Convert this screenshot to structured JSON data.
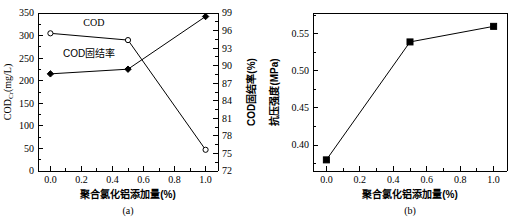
{
  "figure": {
    "panels": [
      {
        "id": "a",
        "caption": "(a)"
      },
      {
        "id": "b",
        "caption": "(b)"
      }
    ]
  },
  "chart_data": [
    {
      "type": "line",
      "panel": "(a)",
      "title": "",
      "xlabel": "聚合氯化铝添加量(%)",
      "ylabel": "CODCr(mg/L)",
      "ylabel_main": "COD",
      "ylabel_sub": "Cr",
      "ylabel_unit": "(mg/L)",
      "y2label": "COD固结率(%)",
      "x": [
        0.0,
        0.5,
        1.0
      ],
      "xlim": [
        -0.08,
        1.08
      ],
      "ylim": [
        0,
        350
      ],
      "y2lim": [
        72,
        99
      ],
      "xticks": [
        0.0,
        0.2,
        0.4,
        0.6,
        0.8,
        1.0
      ],
      "xticklabels": [
        "0.0",
        "0.2",
        "0.4",
        "0.6",
        "0.8",
        "1.0"
      ],
      "yticks": [
        0,
        50,
        100,
        150,
        200,
        250,
        300,
        350
      ],
      "yticklabels": [
        "0",
        "50",
        "100",
        "150",
        "200",
        "250",
        "300",
        "350"
      ],
      "y2ticks": [
        72,
        75,
        78,
        81,
        84,
        87,
        90,
        93,
        96,
        99
      ],
      "y2ticklabels": [
        "72",
        "75",
        "78",
        "81",
        "84",
        "87",
        "90",
        "93",
        "96",
        "99"
      ],
      "grid": false,
      "legend_position": "inline-annotation",
      "series": [
        {
          "name": "COD",
          "axis": "left",
          "marker": "open-circle",
          "values": [
            305,
            290,
            47
          ],
          "annotation": "COD",
          "annotation_x": 0.28,
          "annotation_y": 322
        },
        {
          "name": "COD固结率",
          "axis": "right",
          "marker": "filled-diamond",
          "values": [
            88.6,
            89.4,
            98.4
          ],
          "annotation": "COD固结率",
          "annotation_x": 0.25,
          "annotation_y": 91.5
        }
      ]
    },
    {
      "type": "line",
      "panel": "(b)",
      "title": "",
      "xlabel": "聚合氯化铝添加量(%)",
      "ylabel": "抗压强度(MPa)",
      "x": [
        0.0,
        0.5,
        1.0
      ],
      "xlim": [
        -0.08,
        1.08
      ],
      "ylim": [
        0.365,
        0.578
      ],
      "xticks": [
        0.0,
        0.2,
        0.4,
        0.6,
        0.8,
        1.0
      ],
      "xticklabels": [
        "0.0",
        "0.2",
        "0.4",
        "0.6",
        "0.8",
        "1.0"
      ],
      "yticks": [
        0.4,
        0.45,
        0.5,
        0.55
      ],
      "yticklabels": [
        "0.40",
        "0.45",
        "0.50",
        "0.55"
      ],
      "grid": false,
      "legend_position": "none",
      "series": [
        {
          "name": "抗压强度",
          "axis": "left",
          "marker": "filled-square",
          "values": [
            0.38,
            0.539,
            0.56
          ]
        }
      ]
    }
  ],
  "colors": {
    "axis": "#000000",
    "line": "#000000",
    "marker_fill": "#000000",
    "marker_open_fill": "#ffffff",
    "background": "#ffffff"
  }
}
